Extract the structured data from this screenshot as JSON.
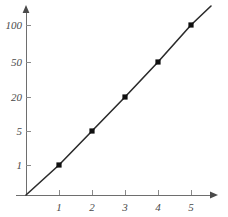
{
  "chart_data": {
    "type": "line",
    "title": "",
    "subtitle": "",
    "xlabel": "",
    "ylabel": "",
    "x": [
      1,
      2,
      3,
      4,
      5
    ],
    "values": [
      1,
      5,
      20,
      50,
      100
    ],
    "series": [
      {
        "name": "",
        "x": [
          1,
          2,
          3,
          4,
          5
        ],
        "values": [
          1,
          5,
          20,
          50,
          100
        ]
      }
    ],
    "y_scale": "log",
    "x_scale": "linear",
    "xlim": [
      0,
      5.7
    ],
    "ylim": [
      0,
      100
    ],
    "x_ticks": [
      1,
      2,
      3,
      4,
      5
    ],
    "x_tick_labels": [
      "1",
      "2",
      "3",
      "4",
      "5"
    ],
    "y_ticks": [
      1,
      5,
      20,
      50,
      100
    ],
    "y_tick_labels": [
      "1",
      "5",
      "20",
      "50",
      "100"
    ],
    "grid": false,
    "legend": null,
    "legend_position": "none",
    "markers": "square",
    "annotations": [],
    "axis_arrows": true,
    "line_color": "#2b2b2b",
    "marker_color": "#101010",
    "axis_color": "#6e6e6e",
    "background_color": "#ffffff"
  },
  "geometry": {
    "origin_x": 26,
    "origin_y": 195,
    "y_axis_top": 10,
    "x_axis_right": 215,
    "x_pixels": [
      59,
      92,
      125,
      158,
      191
    ],
    "y_pixels": [
      165,
      131,
      97,
      62,
      25
    ],
    "line_start": [
      26,
      195
    ],
    "line_end": [
      211,
      6
    ]
  }
}
